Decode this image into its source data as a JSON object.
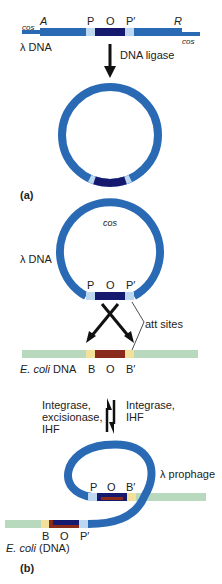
{
  "colors": {
    "lambda_dna": "#2a6ab4",
    "att_core_lambda": "#161a6e",
    "att_flank_lambda": "#bcd7ef",
    "ecoli_dna": "#b9d9bf",
    "att_core_ecoli": "#8a2a1c",
    "att_flank_ecoli": "#f3e09a",
    "arrow": "#111111"
  },
  "panel_a": {
    "linear": {
      "cos_left": "cos",
      "gene_left": "A",
      "site_p": "P",
      "site_o": "O",
      "site_p_prime": "P′",
      "gene_right": "R",
      "cos_right": "cos",
      "name": "λ DNA"
    },
    "arrow_label": "DNA ligase",
    "panel_label": "(a)"
  },
  "panel_b": {
    "circle": {
      "cos": "cos",
      "name": "λ DNA",
      "site_p": "P",
      "site_o": "O",
      "site_p_prime": "P′"
    },
    "att_sites_label": "att sites",
    "ecoli": {
      "name_italic": "E. coli",
      "name_rest": " DNA",
      "site_b": "B",
      "site_o": "O",
      "site_b_prime": "B′"
    },
    "reverse_label": [
      "Integrase,",
      "excisionase,",
      "IHF"
    ],
    "forward_label": [
      "Integrase,",
      "IHF"
    ],
    "prophage": {
      "name": "λ prophage",
      "top_p": "P",
      "top_o": "O",
      "top_b_prime": "B′",
      "bottom_b": "B",
      "bottom_o": "O",
      "bottom_p_prime": "P′",
      "ecoli_italic": "E. coli",
      "ecoli_rest": " (DNA)"
    },
    "panel_label": "(b)"
  }
}
